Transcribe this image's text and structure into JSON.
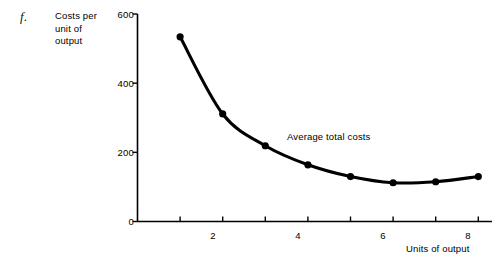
{
  "figure": {
    "panel_label": "f.",
    "background_color": "#ffffff",
    "ink_color": "#000000"
  },
  "chart_data": {
    "type": "line",
    "title": "",
    "subtitle": "",
    "xlabel": "Units of output",
    "ylabel": "Costs per unit of output",
    "ylabel_lines": [
      "Costs per",
      "unit of",
      "output"
    ],
    "x": [
      1,
      2,
      3,
      4,
      5,
      6,
      7,
      8
    ],
    "values": [
      534,
      311,
      219,
      164,
      130,
      112,
      115,
      130
    ],
    "series": [
      {
        "name": "Average total costs",
        "values": [
          534,
          311,
          219,
          164,
          130,
          112,
          115,
          130
        ]
      }
    ],
    "annotations": [
      {
        "text": "Average total costs",
        "x": 4.9,
        "y": 215
      }
    ],
    "xlim": [
      0,
      8.6
    ],
    "ylim": [
      0,
      600
    ],
    "yticks": [
      0,
      200,
      400,
      600
    ],
    "ytick_labels": [
      "0",
      "200",
      "400",
      "600"
    ],
    "xticks": [
      1,
      2,
      3,
      4,
      5,
      6,
      7,
      8
    ],
    "xtick_labels": [
      "",
      "2",
      "",
      "4",
      "",
      "6",
      "",
      "8"
    ],
    "grid": false,
    "legend": "none",
    "marker": "filled-circle",
    "line_color": "#000000",
    "marker_color": "#000000"
  }
}
